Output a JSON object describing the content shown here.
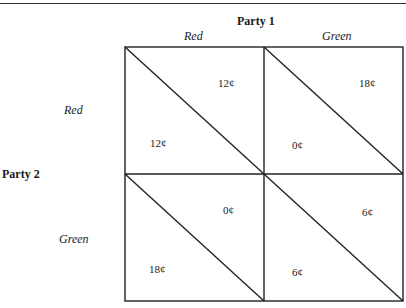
{
  "header": {
    "title_cut": "Payoff Matrix"
  },
  "party1": {
    "label": "Party 1",
    "choices": [
      "Red",
      "Green"
    ]
  },
  "party2": {
    "label": "Party 2",
    "choices": [
      "Red",
      "Green"
    ]
  },
  "cells": [
    {
      "row": "Red",
      "col": "Red",
      "upper_right": "12¢",
      "lower_left": "12¢"
    },
    {
      "row": "Red",
      "col": "Green",
      "upper_right": "18¢",
      "lower_left": "0¢"
    },
    {
      "row": "Green",
      "col": "Red",
      "upper_right": "0¢",
      "lower_left": "18¢"
    },
    {
      "row": "Green",
      "col": "Green",
      "upper_right": "6¢",
      "lower_left": "6¢"
    }
  ],
  "colors": {
    "line": "#222222",
    "background": "#ffffff"
  }
}
